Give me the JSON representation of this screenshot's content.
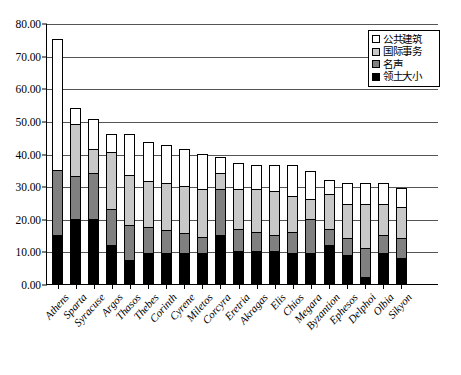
{
  "chart_data": {
    "type": "bar",
    "stacked": true,
    "title": "",
    "subtitle": "",
    "xlabel": "",
    "ylabel": "",
    "ylim": [
      0,
      80
    ],
    "ytick_step": 10,
    "ytick_labels": [
      "0.00",
      "10.00",
      "20.00",
      "30.00",
      "40.00",
      "50.00",
      "60.00",
      "70.00",
      "80.00"
    ],
    "grid": "horizontal",
    "legend_position": "top-right",
    "categories": [
      "Athens",
      "Sparta",
      "Syracuse",
      "Argos",
      "Thasos",
      "Thebes",
      "Corinth",
      "Cyrene",
      "Miletos",
      "Corcyra",
      "Eretria",
      "Akragas",
      "Elis",
      "Chios",
      "Megara",
      "Byzantion",
      "Ephesos",
      "Delphoi",
      "Olbia",
      "Sikyon"
    ],
    "series": [
      {
        "name": "领土大小",
        "color": "#000000",
        "values": [
          15.0,
          20.0,
          20.0,
          12.0,
          7.5,
          9.5,
          9.5,
          9.5,
          9.5,
          15.0,
          10.0,
          10.0,
          10.0,
          9.5,
          9.5,
          12.0,
          9.0,
          2.0,
          9.5,
          8.0
        ]
      },
      {
        "name": "名声",
        "color": "#808080",
        "values": [
          20.0,
          13.0,
          14.0,
          11.0,
          10.5,
          8.0,
          7.0,
          6.0,
          5.0,
          14.0,
          7.0,
          6.0,
          5.0,
          6.5,
          10.5,
          5.0,
          5.0,
          9.0,
          5.5,
          6.0
        ]
      },
      {
        "name": "国际事务",
        "color": "#c8c8c8",
        "values": [
          0.0,
          16.0,
          7.5,
          17.5,
          15.5,
          14.0,
          14.5,
          14.5,
          14.5,
          5.0,
          12.0,
          13.0,
          13.5,
          11.0,
          6.0,
          10.5,
          10.5,
          13.5,
          9.5,
          9.5
        ]
      },
      {
        "name": "公共建筑",
        "color": "#ffffff",
        "values": [
          40.0,
          5.0,
          9.0,
          5.5,
          12.5,
          12.0,
          11.5,
          11.5,
          11.0,
          5.0,
          8.0,
          7.5,
          8.0,
          9.5,
          8.5,
          4.5,
          6.5,
          6.5,
          6.5,
          6.0
        ]
      }
    ]
  },
  "legend": {
    "items": [
      {
        "label": "公共建筑",
        "swatch": "#ffffff"
      },
      {
        "label": "国际事务",
        "swatch": "#c8c8c8"
      },
      {
        "label": "名声",
        "swatch": "#808080"
      },
      {
        "label": "领土大小",
        "swatch": "#000000"
      }
    ]
  }
}
